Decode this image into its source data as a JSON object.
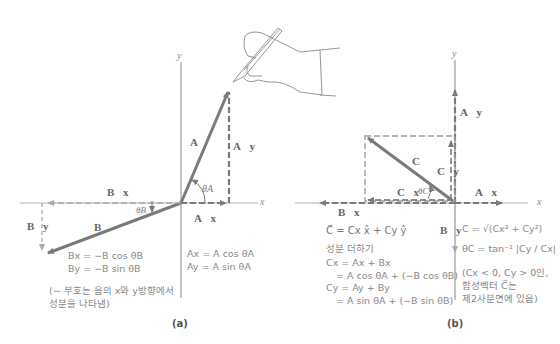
{
  "panel_a": {
    "caption": "(a)",
    "axis_x": "x",
    "axis_y": "y",
    "labels": {
      "A": "A⃗",
      "Ay": "A⃗y",
      "Ax": "A⃗x",
      "B": "B⃗",
      "Bx": "B⃗x",
      "By": "B⃗y",
      "thetaA": "θA",
      "thetaB": "θB"
    },
    "equations_A": [
      "Ax = A cos θA",
      "Ay = A sin θA"
    ],
    "equations_B": [
      "Bx = −B cos θB",
      "By = −B sin θB"
    ],
    "note": [
      "(− 부호는 음의 x와 y방향에서",
      "성분을 나타냄)"
    ]
  },
  "panel_b": {
    "caption": "(b)",
    "axis_x": "x",
    "axis_y": "y",
    "labels": {
      "Ay": "A⃗y",
      "Ax": "A⃗x",
      "C": "C⃗",
      "Cy": "C⃗y",
      "Cx": "C⃗x",
      "Bx": "B⃗x",
      "By": "B⃗y",
      "thetaC": "θC"
    },
    "resultant": "C⃗ = Cx x̂ + Cy ŷ",
    "adding_title": "성분 더하기",
    "equations_sum": [
      "Cx = Ax + Bx",
      "= A cos θA + (−B cos θB)",
      "Cy = Ay + By",
      "= A sin θA + (−B sin θB)"
    ],
    "magnitude": "C = √(Cx² + Cy²)",
    "angle": "θC = tan⁻¹ |Cy / Cx|",
    "note": [
      "(Cx < 0, Cy > 0인,",
      "합성벡터 C⃗는",
      "제2사분면에 있음)"
    ]
  },
  "colors": {
    "vector": "#7a7a7a",
    "axis": "#8a8a8a",
    "text": "#888888"
  }
}
